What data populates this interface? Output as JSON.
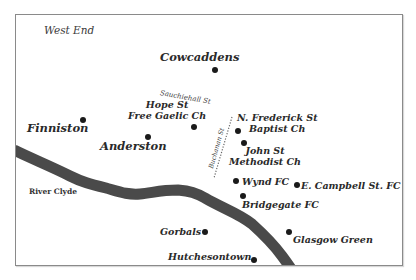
{
  "map": {
    "title_region": "West End",
    "colors": {
      "river": "#4a4a4a",
      "dot": "#1a1a1a",
      "text": "#2a2a2a",
      "frame": "#8a8a8a",
      "background": "#ffffff"
    },
    "river": {
      "label": "River Clyde"
    },
    "streets": [
      {
        "id": "sauchiehall",
        "label": "Sauchiehall St"
      },
      {
        "id": "buchanan",
        "label": "Buchanan St"
      }
    ],
    "places": [
      {
        "id": "cowcaddens",
        "label": "Cowcaddens"
      },
      {
        "id": "finniston",
        "label": "Finniston"
      },
      {
        "id": "anderston",
        "label": "Anderston"
      },
      {
        "id": "hope-st",
        "label_line1": "Hope St",
        "label_line2": "Free Gaelic Ch"
      },
      {
        "id": "n-frederick",
        "label_line1": "N. Frederick  St",
        "label_line2": "Baptist Ch"
      },
      {
        "id": "john-st",
        "label_line1": "John St",
        "label_line2": "Methodist Ch"
      },
      {
        "id": "wynd-fc",
        "label": "Wynd FC"
      },
      {
        "id": "e-campbell",
        "label": "E. Campbell St. FC"
      },
      {
        "id": "bridgegate-fc",
        "label": "Bridgegate FC"
      },
      {
        "id": "gorbals",
        "label": "Gorbals"
      },
      {
        "id": "glasgow-green",
        "label": "Glasgow Green"
      },
      {
        "id": "hutchesontown",
        "label": "Hutchesontown"
      }
    ]
  }
}
